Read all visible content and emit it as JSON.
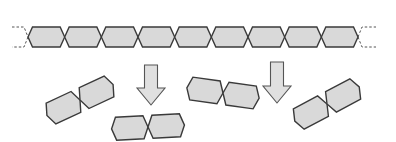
{
  "diagram": {
    "title": "",
    "colors": {
      "unit_fill": "#d9d9d9",
      "unit_stroke": "#3a3a3a",
      "arrow_fill": "#e0e0e0",
      "arrow_stroke": "#555555",
      "background": "#ffffff"
    },
    "chain": {
      "unit_count": 9,
      "x_start": 28,
      "x_end": 358,
      "y_top": 27,
      "y_bottom": 47,
      "open_ends": "dashed"
    },
    "arrows": [
      {
        "direction": "down",
        "x_center": 151,
        "y_top": 65,
        "y_bottom": 105
      },
      {
        "direction": "down",
        "x_center": 277,
        "y_top": 62,
        "y_bottom": 103
      }
    ],
    "fragments": [
      {
        "units": 2,
        "cx": 80,
        "cy": 100,
        "angle_deg": -25
      },
      {
        "units": 2,
        "cx": 148,
        "cy": 127,
        "angle_deg": -3
      },
      {
        "units": 2,
        "cx": 223,
        "cy": 93,
        "angle_deg": 8
      },
      {
        "units": 2,
        "cx": 327,
        "cy": 104,
        "angle_deg": -28
      }
    ],
    "labels": []
  }
}
